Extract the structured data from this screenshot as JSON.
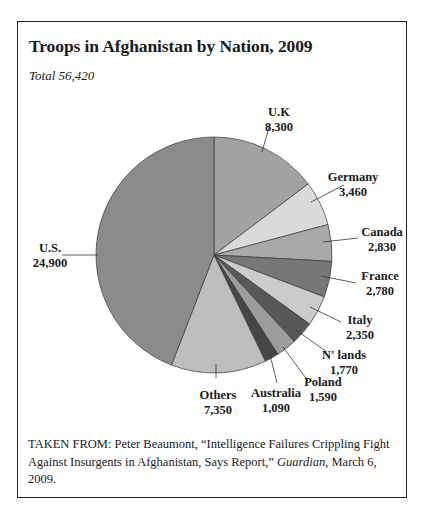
{
  "title": "Troops in Afghanistan by Nation, 2009",
  "subtitle": "Total 56,420",
  "source": {
    "prefix": "TAKEN FROM: Peter Beaumont, “Intelligence Failures Crippling Fight Against Insurgents in Afghanistan, Says Report,” ",
    "publication": "Guardian",
    "suffix": ", March 6, 2009."
  },
  "chart_data": {
    "type": "pie",
    "title": "Troops in Afghanistan by Nation, 2009",
    "subtitle": "Total 56,420",
    "total": 56420,
    "start_angle": "12 o'clock, clockwise",
    "categories": [
      "U.K",
      "Germany",
      "Canada",
      "France",
      "Italy",
      "N' lands",
      "Poland",
      "Australia",
      "Others",
      "U.S."
    ],
    "values": [
      8300,
      3460,
      2830,
      2780,
      2350,
      1770,
      1590,
      1090,
      7350,
      24900
    ],
    "labels": [
      "8,300",
      "3,460",
      "2,830",
      "2,780",
      "2,350",
      "1,770",
      "1,590",
      "1,090",
      "7,350",
      "24,900"
    ],
    "colors": [
      "#a2a2a2",
      "#dadada",
      "#a9a9a9",
      "#777777",
      "#cbcbcb",
      "#585858",
      "#9c9c9c",
      "#474747",
      "#bdbdbd",
      "#8b8b8b"
    ],
    "legend": "none (callout labels)"
  }
}
